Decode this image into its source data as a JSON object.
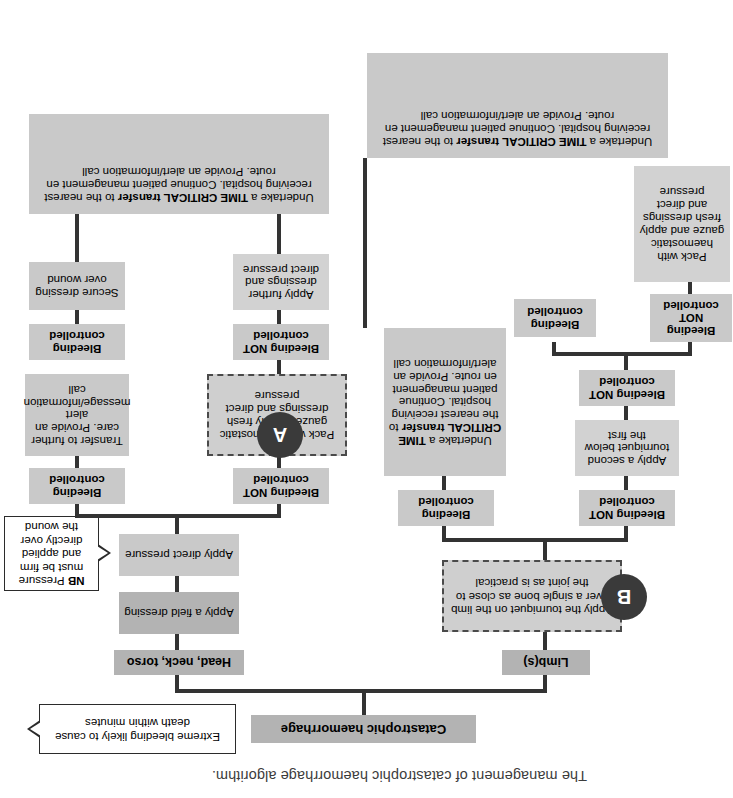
{
  "title": "The management of catastrophic haemorrhage algorithm.",
  "colors": {
    "box_fill": "#c9c9c9",
    "box_fill_light": "#d2d2d2",
    "box_fill_dark": "#b3b3b3",
    "line": "#333333",
    "marker_circle": "#3a3a3a",
    "callout_border": "#2b2b2b"
  },
  "root": {
    "label": "Catastrophic haemorrhage",
    "callout": "Extreme bleeding likely to cause death within minutes"
  },
  "branches": {
    "limbs": {
      "label": "Limb(s)",
      "marker": "B",
      "marker_box": "Apply the tourniquet on the limb over a single bone as close to the joint as is practical",
      "outcome_controlled": "Bleeding controlled",
      "outcome_not_controlled": "Bleeding NOT controlled",
      "controlled_action": "Undertake a TIME CRITICAL transfer to the nearest receiving hospital. Continue patient management en route. Provide an alert/information call",
      "controlled_action_bold": "TIME CRITICAL transfer",
      "not_controlled_action": "Apply a second tourniquet below the first",
      "second_outcome_controlled": "Bleeding controlled",
      "second_outcome_not_controlled": "Bleeding NOT controlled",
      "second_not_controlled_action": "Pack with haemostatic gauze and apply fresh dressings and direct pressure",
      "final_transfer": "Undertake a TIME CRITICAL transfer to the nearest receiving hospital. Continue patient management en route. Provide an alert/information call"
    },
    "head_neck_torso": {
      "label": "Head, neck, torso",
      "step1": "Apply a field dressing",
      "step2": "Apply direct pressure",
      "callout": "NB Pressure must be firm and applied directly over the wound",
      "callout_bold": "NB",
      "outcome_controlled": "Bleeding controlled",
      "outcome_not_controlled": "Bleeding NOT controlled",
      "controlled_action": "Transfer to further care. Provide an alert message/information call",
      "marker": "A",
      "marker_box": "Pack with haemostatic gauze – apply fresh dressings and direct pressure",
      "second_outcome_controlled": "Bleeding controlled",
      "second_outcome_not_controlled": "Bleeding NOT controlled",
      "second_controlled_action": "Secure dressing over wound",
      "second_not_controlled_action": "Apply further dressings and direct pressure",
      "final_transfer": "Undertake a TIME CRITICAL transfer to the nearest receiving hospital. Continue patient management en route. Provide an alert/information call"
    }
  },
  "shared": {
    "undertake_prefix": "Undertake a ",
    "time_critical": "TIME CRITICAL transfer",
    "transfer_rest": " to the nearest receiving hospital. Continue patient management en route. Provide an alert/information call"
  }
}
